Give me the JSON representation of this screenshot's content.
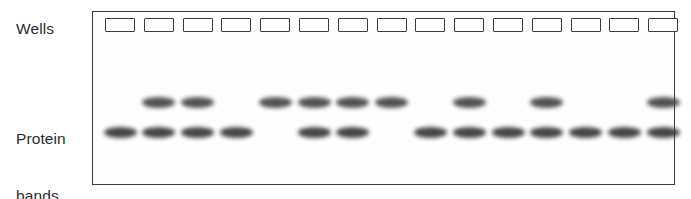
{
  "figure": {
    "kind": "gel-electrophoresis-diagram",
    "background_color": "#ffffff",
    "ink_color": "#3a3a3a"
  },
  "labels": {
    "wells": "Wells",
    "protein_bands_line1": "Protein",
    "protein_bands_line2": "bands"
  },
  "gel": {
    "border_color": "#3a3a3a",
    "fill_color": "#fefefe",
    "left": 92,
    "top": 11,
    "width": 583,
    "height": 174,
    "lane_count": 15,
    "first_lane_center_x": 120,
    "lane_pitch": 38.8
  },
  "well": {
    "width": 30,
    "height": 14,
    "top": 18,
    "border_color": "#3b3b3b",
    "fill_color": "#ffffff"
  },
  "band_rows": {
    "upper_y": 97,
    "lower_y": 127,
    "width": 33,
    "height": 11,
    "upper_color": "#454545",
    "lower_color": "#363636"
  },
  "chart_data": {
    "type": "table",
    "xlabel": "Lane",
    "ylabel": "Band position",
    "row_labels": [
      "upper band",
      "lower band"
    ],
    "categories": [
      1,
      2,
      3,
      4,
      5,
      6,
      7,
      8,
      9,
      10,
      11,
      12,
      13,
      14,
      15
    ],
    "series": [
      {
        "name": "upper band",
        "values": [
          0,
          1,
          1,
          0,
          1,
          1,
          1,
          1,
          0,
          1,
          0,
          1,
          0,
          0,
          1
        ]
      },
      {
        "name": "lower band",
        "values": [
          1,
          1,
          1,
          1,
          0,
          1,
          1,
          0,
          1,
          1,
          1,
          1,
          1,
          1,
          1
        ]
      }
    ],
    "lanes": [
      {
        "lane": 1,
        "upper": false,
        "lower": true
      },
      {
        "lane": 2,
        "upper": true,
        "lower": true
      },
      {
        "lane": 3,
        "upper": true,
        "lower": true
      },
      {
        "lane": 4,
        "upper": false,
        "lower": true
      },
      {
        "lane": 5,
        "upper": true,
        "lower": false
      },
      {
        "lane": 6,
        "upper": true,
        "lower": true
      },
      {
        "lane": 7,
        "upper": true,
        "lower": true
      },
      {
        "lane": 8,
        "upper": true,
        "lower": false
      },
      {
        "lane": 9,
        "upper": false,
        "lower": true
      },
      {
        "lane": 10,
        "upper": true,
        "lower": true
      },
      {
        "lane": 11,
        "upper": false,
        "lower": true
      },
      {
        "lane": 12,
        "upper": true,
        "lower": true
      },
      {
        "lane": 13,
        "upper": false,
        "lower": true
      },
      {
        "lane": 14,
        "upper": false,
        "lower": true
      },
      {
        "lane": 15,
        "upper": true,
        "lower": true
      }
    ]
  }
}
